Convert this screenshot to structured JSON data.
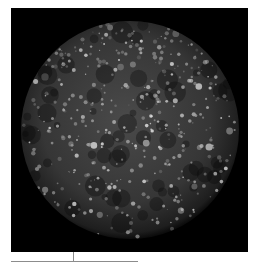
{
  "image": {
    "subject": "cratered moon (Callisto) on black background",
    "frame": {
      "x": 11,
      "y": 8,
      "width": 237,
      "height": 244,
      "color": "#000000"
    },
    "moon": {
      "cx": 130,
      "cy": 130,
      "r": 109,
      "base_color": "#3a3a3a",
      "limb_color": "#151515"
    },
    "craters_seed": 7,
    "crater_count": 420
  },
  "scale_bar": {
    "line": {
      "x1": 11,
      "x2": 138,
      "y": 261,
      "color": "#8c8c8c"
    },
    "tick": {
      "x": 73,
      "y1": 252,
      "y2": 262
    }
  }
}
